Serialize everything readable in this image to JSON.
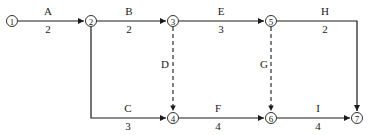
{
  "diagram": {
    "type": "activity-on-arrow network",
    "nodes": [
      {
        "id": "1",
        "label": "1",
        "x": 12,
        "y": 21
      },
      {
        "id": "2",
        "label": "2",
        "x": 91,
        "y": 21
      },
      {
        "id": "3",
        "label": "3",
        "x": 173,
        "y": 21
      },
      {
        "id": "4",
        "label": "4",
        "x": 173,
        "y": 118
      },
      {
        "id": "5",
        "label": "5",
        "x": 271,
        "y": 21
      },
      {
        "id": "6",
        "label": "6",
        "x": 271,
        "y": 118
      },
      {
        "id": "7",
        "label": "7",
        "x": 357,
        "y": 118
      }
    ],
    "activities": [
      {
        "name": "A",
        "duration": "2",
        "from": "1",
        "to": "2",
        "dummy": false
      },
      {
        "name": "B",
        "duration": "2",
        "from": "2",
        "to": "3",
        "dummy": false
      },
      {
        "name": "E",
        "duration": "3",
        "from": "3",
        "to": "5",
        "dummy": false
      },
      {
        "name": "H",
        "duration": "2",
        "from": "5",
        "to": "7",
        "dummy": false
      },
      {
        "name": "C",
        "duration": "3",
        "from": "2",
        "to": "4",
        "dummy": false
      },
      {
        "name": "F",
        "duration": "4",
        "from": "4",
        "to": "6",
        "dummy": false
      },
      {
        "name": "I",
        "duration": "4",
        "from": "6",
        "to": "7",
        "dummy": false
      },
      {
        "name": "D",
        "duration": "",
        "from": "3",
        "to": "4",
        "dummy": true
      },
      {
        "name": "G",
        "duration": "",
        "from": "5",
        "to": "6",
        "dummy": true
      }
    ]
  }
}
